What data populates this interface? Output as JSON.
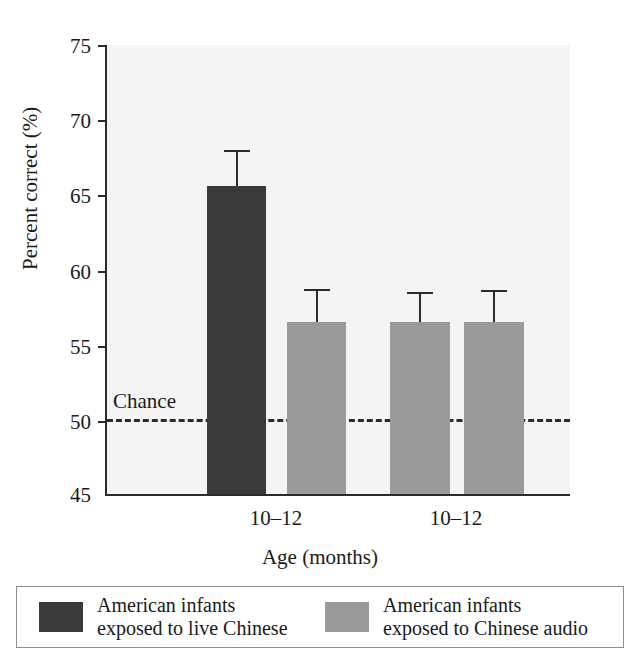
{
  "chart_data": {
    "type": "bar",
    "title": "",
    "xlabel": "Age (months)",
    "ylabel": "Percent correct (%)",
    "ylim": [
      45,
      75
    ],
    "yticks": [
      75,
      70,
      65,
      60,
      55,
      50,
      45
    ],
    "ytick_labels": [
      "75",
      "70",
      "65",
      "60",
      "55",
      "50",
      "45"
    ],
    "grid": false,
    "legend_position": "bottom",
    "categories": [
      "10–12",
      "10–12"
    ],
    "group_labels": [
      "10–12",
      "10–12"
    ],
    "reference_line": {
      "label": "Chance",
      "value": 50,
      "style": "dashed"
    },
    "series": [
      {
        "name": "American infants exposed to live Chinese",
        "color": "#3a3a3a",
        "values": [
          65.6,
          null
        ],
        "errors": [
          2.4,
          null
        ]
      },
      {
        "name": "American infants exposed to Chinese audio",
        "color": "#9a9a9a",
        "values": [
          56.5,
          56.5
        ],
        "errors": [
          2.2,
          2.1
        ]
      }
    ],
    "bars": [
      {
        "label": "live-chinese-10-12",
        "group": 0,
        "value": 65.6,
        "error_high": 68.0,
        "color": "#3a3a3a"
      },
      {
        "label": "audio-10-12-a",
        "group": 0,
        "value": 56.5,
        "error_high": 58.7,
        "color": "#9a9a9a"
      },
      {
        "label": "audio-10-12-b",
        "group": 1,
        "value": 56.5,
        "error_high": 58.5,
        "color": "#9a9a9a"
      },
      {
        "label": "audio-10-12-c",
        "group": 1,
        "value": 56.5,
        "error_high": 58.6,
        "color": "#9a9a9a"
      }
    ]
  },
  "axis": {
    "y_label": "Percent correct (%)",
    "x_label": "Age (months)",
    "y_ticks": [
      "75",
      "70",
      "65",
      "60",
      "55",
      "50",
      "45"
    ],
    "x_ticks": [
      "10–12",
      "10–12"
    ]
  },
  "annotations": {
    "chance": "Chance"
  },
  "legend": {
    "items": [
      {
        "swatch_color": "#3a3a3a",
        "line1": "American infants",
        "line2": "exposed to live Chinese"
      },
      {
        "swatch_color": "#9a9a9a",
        "line1": "American infants",
        "line2": "exposed to Chinese audio"
      }
    ]
  },
  "colors": {
    "dark_bar": "#3a3a3a",
    "light_bar": "#9a9a9a",
    "axis": "#2b2b2b",
    "plot_background": "#f4f4f4",
    "page_background": "#ffffff"
  }
}
